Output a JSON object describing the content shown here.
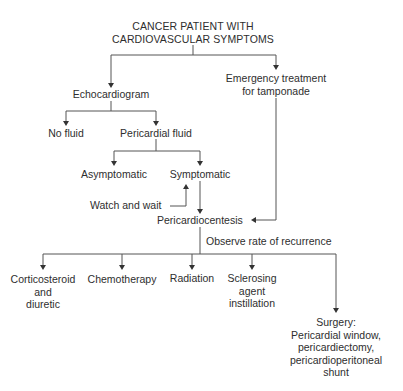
{
  "diagram": {
    "root": {
      "line1": "CANCER PATIENT WITH",
      "line2": "CARDIOVASCULAR SYMPTOMS"
    },
    "nodes": {
      "echocardiogram": "Echocardiogram",
      "emergency": {
        "line1": "Emergency treatment",
        "line2": "for tamponade"
      },
      "no_fluid": "No fluid",
      "pericardial_fluid": "Pericardial fluid",
      "asymptomatic": "Asymptomatic",
      "symptomatic": "Symptomatic",
      "watch_wait": "Watch and wait",
      "pericardiocentesis": "Pericardiocentesis",
      "observe": "Observe rate of recurrence",
      "corticosteroid": {
        "line1": "Corticosteroid",
        "line2": "and",
        "line3": "diuretic"
      },
      "chemotherapy": "Chemotherapy",
      "radiation": "Radiation",
      "sclerosing": {
        "line1": "Sclerosing",
        "line2": "agent",
        "line3": "instillation"
      },
      "surgery": {
        "line1": "Surgery:",
        "line2": "Pericardial window,",
        "line3": "pericardiectomy,",
        "line4": "pericardioperitoneal",
        "line5": "shunt"
      }
    },
    "colors": {
      "line": "#555555",
      "text": "#2e2e2e",
      "background": "#ffffff"
    }
  }
}
